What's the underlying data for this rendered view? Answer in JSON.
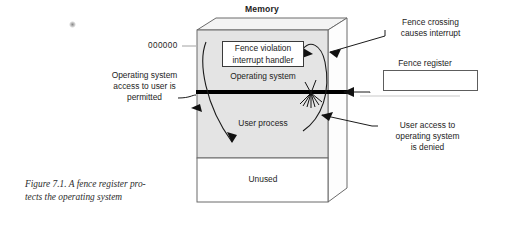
{
  "figure": {
    "title": "Memory",
    "caption_line1": "Figure 7.1. A fence register pro-",
    "caption_line2": "tects the operating system"
  },
  "memory_box": {
    "address_label": "000000",
    "segments": [
      {
        "name": "operating-system",
        "label": "Operating system",
        "fill": "#e4e4e4"
      },
      {
        "name": "user-process",
        "label": "User process",
        "fill": "#e4e4e4"
      },
      {
        "name": "unused",
        "label": "Unused",
        "fill": "#ffffff"
      }
    ],
    "inner_box": {
      "line1": "Fence violation",
      "line2": "interrupt handler"
    },
    "fence_color": "#000000"
  },
  "fence_register": {
    "label": "Fence register",
    "value": ""
  },
  "annotations": {
    "left": {
      "line1": "Operating system",
      "line2": "access to user is",
      "line3": "permitted"
    },
    "top_right": {
      "line1": "Fence crossing",
      "line2": "causes interrupt"
    },
    "bottom_right": {
      "line1": "User access to",
      "line2": "operating system",
      "line3": "is denied"
    }
  }
}
